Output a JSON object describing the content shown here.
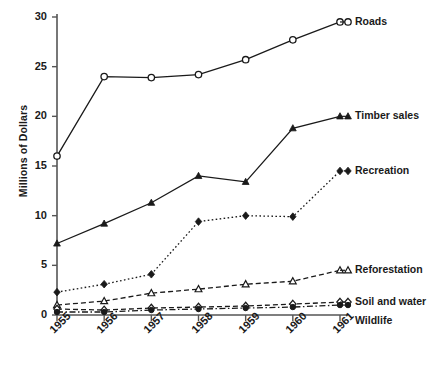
{
  "chart_data": {
    "type": "line",
    "title": "",
    "xlabel": "",
    "ylabel": "Millions of Dollars",
    "categories": [
      "1955",
      "1956",
      "1957",
      "1958",
      "1959",
      "1960",
      "1961"
    ],
    "x": [
      1955,
      1956,
      1957,
      1958,
      1959,
      1960,
      1961
    ],
    "ylim": [
      0,
      30
    ],
    "yticks": [
      0,
      5,
      10,
      15,
      20,
      25,
      30
    ],
    "ytick_labels": [
      "0",
      "5",
      "10",
      "15",
      "20",
      "25",
      "30"
    ],
    "grid": false,
    "legend_position": "right-inline",
    "series": [
      {
        "name": "Roads",
        "values": [
          16.0,
          24.0,
          23.9,
          24.2,
          25.7,
          27.7,
          29.5
        ],
        "marker": "open-circle",
        "line_style": "solid",
        "color": "#1a1a1a"
      },
      {
        "name": "Timber sales",
        "values": [
          7.2,
          9.2,
          11.3,
          14.0,
          13.4,
          18.8,
          20.0
        ],
        "marker": "filled-triangle",
        "line_style": "solid",
        "color": "#1a1a1a"
      },
      {
        "name": "Recreation",
        "values": [
          2.3,
          3.1,
          4.1,
          9.4,
          10.0,
          9.9,
          14.5
        ],
        "marker": "filled-diamond",
        "line_style": "dotted",
        "color": "#1a1a1a"
      },
      {
        "name": "Reforestation",
        "values": [
          1.0,
          1.4,
          2.2,
          2.6,
          3.1,
          3.4,
          4.5
        ],
        "marker": "open-triangle",
        "line_style": "dashed",
        "color": "#1a1a1a"
      },
      {
        "name": "Soil and water",
        "values": [
          0.6,
          0.5,
          0.7,
          0.8,
          0.9,
          1.1,
          1.3
        ],
        "marker": "open-diamond",
        "line_style": "dashed",
        "color": "#1a1a1a"
      },
      {
        "name": "Wildlife",
        "values": [
          0.3,
          0.3,
          0.5,
          0.6,
          0.7,
          0.8,
          1.0
        ],
        "marker": "filled-circle",
        "line_style": "dash-dot",
        "color": "#1a1a1a"
      }
    ]
  },
  "legend": {
    "entries": [
      {
        "label": "Roads"
      },
      {
        "label": "Timber sales"
      },
      {
        "label": "Recreation"
      },
      {
        "label": "Reforestation"
      },
      {
        "label": "Soil and water"
      },
      {
        "label": "Wildlife"
      }
    ]
  },
  "axes": {
    "y_title": "Millions of Dollars"
  }
}
